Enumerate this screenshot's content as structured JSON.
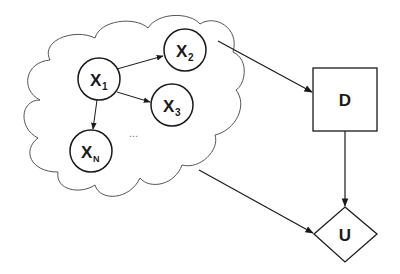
{
  "diagram": {
    "type": "influence-diagram",
    "cloud": {
      "label": "chance-variable-cluster"
    },
    "nodes": [
      {
        "id": "X1",
        "base": "X",
        "sub": "1",
        "shape": "circle"
      },
      {
        "id": "X2",
        "base": "X",
        "sub": "2",
        "shape": "circle"
      },
      {
        "id": "X3",
        "base": "X",
        "sub": "3",
        "shape": "circle"
      },
      {
        "id": "XN",
        "base": "X",
        "sub": "N",
        "shape": "circle"
      },
      {
        "id": "D",
        "base": "D",
        "shape": "rectangle",
        "role": "decision"
      },
      {
        "id": "U",
        "base": "U",
        "shape": "diamond",
        "role": "utility"
      }
    ],
    "ellipsis": "...",
    "edges": [
      {
        "from": "X1",
        "to": "X2"
      },
      {
        "from": "X1",
        "to": "X3"
      },
      {
        "from": "X1",
        "to": "XN"
      },
      {
        "from": "cloud",
        "to": "D"
      },
      {
        "from": "cloud",
        "to": "U"
      },
      {
        "from": "D",
        "to": "U"
      }
    ],
    "colors": {
      "stroke": "#1a1a1a",
      "cloud_stroke": "#555555",
      "background": "#ffffff"
    }
  }
}
